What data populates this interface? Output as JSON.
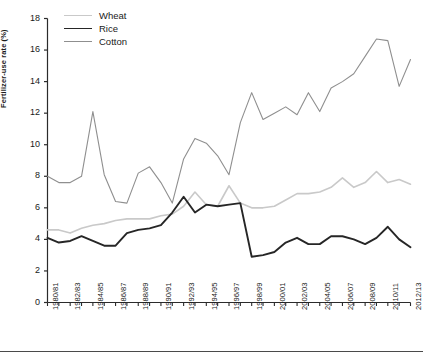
{
  "chart_data": {
    "type": "line",
    "title": "",
    "xlabel": "",
    "ylabel": "Fertilizer-use rate (%)",
    "ylim": [
      0,
      18
    ],
    "ytick_step": 2,
    "yticks": [
      0,
      2,
      4,
      6,
      8,
      10,
      12,
      14,
      16,
      18
    ],
    "grid": false,
    "legend_position": "top-left",
    "x": [
      "1980/81",
      "1981/82",
      "1982/83",
      "1983/84",
      "1984/85",
      "1985/86",
      "1986/87",
      "1987/88",
      "1988/89",
      "1989/90",
      "1990/91",
      "1991/92",
      "1992/93",
      "1993/94",
      "1994/95",
      "1995/96",
      "1996/97",
      "1997/98",
      "1998/99",
      "1999/2000",
      "2000/01",
      "2001/02",
      "2002/03",
      "2003/04",
      "2004/05",
      "2005/06",
      "2006/07",
      "2007/08",
      "2008/09",
      "2009/10",
      "2010/11",
      "2011/12",
      "2012/13"
    ],
    "xtick_labels": [
      "1980/81",
      "1982/83",
      "1984/85",
      "1986/87",
      "1988/89",
      "1990/91",
      "1992/93",
      "1994/95",
      "1996/97",
      "1998/99",
      "2000/01",
      "2002/03",
      "2004/05",
      "2006/07",
      "2008/09",
      "2010/11",
      "2012/13"
    ],
    "series": [
      {
        "name": "Wheat",
        "color": "#c9c9c9",
        "values": [
          4.6,
          4.6,
          4.4,
          4.7,
          4.9,
          5.0,
          5.2,
          5.3,
          5.3,
          5.3,
          5.5,
          5.6,
          6.1,
          7.0,
          6.2,
          6.1,
          7.4,
          6.3,
          6.0,
          6.0,
          6.1,
          6.5,
          6.9,
          6.9,
          7.0,
          7.3,
          7.9,
          7.3,
          7.6,
          8.3,
          7.6,
          7.8,
          7.5
        ]
      },
      {
        "name": "Rice",
        "color": "#262626",
        "values": [
          4.1,
          3.8,
          3.9,
          4.2,
          3.9,
          3.6,
          3.6,
          4.4,
          4.6,
          4.7,
          4.9,
          5.7,
          6.7,
          5.7,
          6.2,
          6.1,
          6.2,
          6.3,
          2.9,
          3.0,
          3.2,
          3.8,
          4.1,
          3.7,
          3.7,
          4.2,
          4.2,
          4.0,
          3.7,
          4.1,
          4.8,
          4.0,
          3.5
        ]
      },
      {
        "name": "Cotton",
        "color": "#8f8f8f",
        "values": [
          8.0,
          7.6,
          7.6,
          8.0,
          12.1,
          8.1,
          6.4,
          6.3,
          8.2,
          8.6,
          7.6,
          6.3,
          9.1,
          10.4,
          10.1,
          9.3,
          8.1,
          11.4,
          13.3,
          11.6,
          12.0,
          12.4,
          11.9,
          13.3,
          12.1,
          13.6,
          14.0,
          14.5,
          15.6,
          16.7,
          16.6,
          13.7,
          15.4
        ]
      }
    ]
  },
  "legend": {
    "items": [
      {
        "label": "Wheat"
      },
      {
        "label": "Rice"
      },
      {
        "label": "Cotton"
      }
    ]
  }
}
